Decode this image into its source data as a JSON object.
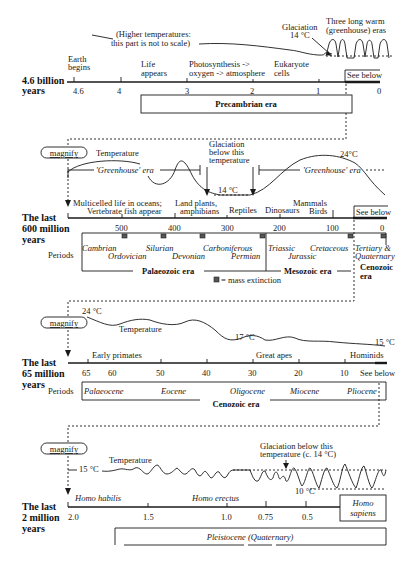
{
  "panel1": {
    "title_line1": "4.6 billion",
    "title_line2": "years",
    "note_line1": "(Higher temperatures:",
    "note_line2": "this part is not to scale)",
    "glaciation_label": "Glaciation",
    "glaciation_temp": "14 °C",
    "warm_label_line1": "Three long warm",
    "warm_label_line2": "(greenhouse) eras",
    "ticks": [
      "4.6",
      "4",
      "3",
      "2",
      "1",
      "0"
    ],
    "events": [
      {
        "line1": "Earth",
        "line2": "begins"
      },
      {
        "line1": "Life",
        "line2": "appears"
      },
      {
        "line1": "Photosynthesis ->",
        "line2": "oxygen -> atmosphere"
      },
      {
        "line1": "Eukaryote",
        "line2": "cells"
      }
    ],
    "see_below": "See below",
    "era": "Precambrian era"
  },
  "panel2": {
    "magnify": "magnify",
    "temperature_label": "Temperature",
    "greenhouse_1": "'Greenhouse' era",
    "greenhouse_2": "'Greenhouse' era",
    "glaciation_line1": "Glaciation",
    "glaciation_line2": "below this",
    "glaciation_line3": "temperature",
    "temp_low": "14 °C",
    "temp_high": "24°C",
    "title_line1": "The last",
    "title_line2": "600 million",
    "title_line3": "years",
    "events": [
      {
        "line1": "Multicelled life in oceans;",
        "line2": "Vertebrate fish appear"
      },
      {
        "line1": "Land plants,",
        "line2": "amphibians"
      },
      {
        "line1": "Reptiles",
        "line2": ""
      },
      {
        "line1": "Dinosaurs",
        "line2": ""
      },
      {
        "line1": "Mammals",
        "line2": "Birds"
      }
    ],
    "see_below": "See below",
    "ticks": [
      "500",
      "400",
      "300",
      "200",
      "100",
      "0"
    ],
    "periods_label": "Periods",
    "periods": [
      "Cambrian",
      "Ordovician",
      "Silurian",
      "Devonian",
      "Carboniferous",
      "Permian",
      "Triassic",
      "Jurassic",
      "Cretaceous",
      "Tertiary &",
      "Quaternary"
    ],
    "eras": [
      "Palaeozoic era",
      "Mesozoic era",
      "Cenozoic",
      "era"
    ],
    "legend": "= mass extinction"
  },
  "panel3": {
    "magnify": "magnify",
    "temp_start": "24 °C",
    "temperature_label": "Temperature",
    "temp_mid": "17 °C",
    "temp_end": "15 °C",
    "title_line1": "The last",
    "title_line2": "65 million",
    "title_line3": "years",
    "events": [
      "Early primates",
      "Great apes",
      "Hominids"
    ],
    "ticks": [
      "65",
      "60",
      "50",
      "40",
      "30",
      "20",
      "10"
    ],
    "see_below": "See below",
    "periods_label": "Periods",
    "periods": [
      "Palaeocene",
      "Eocene",
      "Oligocene",
      "Miocene",
      "Pliocene"
    ],
    "era": "Cenozoic era"
  },
  "panel4": {
    "magnify": "magnify",
    "temp_start": "15 °C",
    "temperature_label": "Temperature",
    "glaciation_line1": "Glaciation below this",
    "glaciation_line2": "temperature (c. 14 °C)",
    "temp_low": "10 °C",
    "title_line1": "The last",
    "title_line2": "2 million",
    "title_line3": "years",
    "species": [
      "Homo habilis",
      "Homo  erectus"
    ],
    "ticks": [
      "2.0",
      "1.5",
      "1.0",
      "0.75",
      "0.5"
    ],
    "homo_sapiens_line1": "Homo",
    "homo_sapiens_line2": "sapiens",
    "period": "Pleistocene (Quaternary)"
  }
}
